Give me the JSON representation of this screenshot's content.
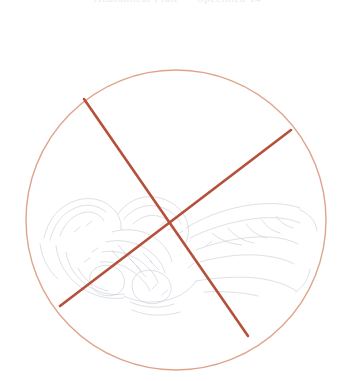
{
  "figure": {
    "caption_top": "Anatomical Plate — Specimen 14",
    "circle": {
      "center_x": 176,
      "center_y": 220,
      "radius": 150,
      "stroke_color": "#e0a48a",
      "stroke_width": 1.4,
      "fill": "none"
    },
    "cross_mark": {
      "label": "invalid-specimen-cross",
      "stroke_color": "#b5503a",
      "stroke_width": 2.6,
      "strokes": [
        {
          "name": "stroke-nw-se",
          "x1": 84,
          "y1": 99,
          "x2": 248,
          "y2": 336
        },
        {
          "name": "stroke-ne-sw",
          "x1": 291,
          "y1": 130,
          "x2": 60,
          "y2": 306
        }
      ]
    },
    "specimen_drawing": {
      "label": "pelvic-bone-sketch",
      "stroke_color": "#9aa3b4",
      "stroke_width": 0.6,
      "opacity": 0.55
    },
    "background_color": "#ffffff"
  }
}
